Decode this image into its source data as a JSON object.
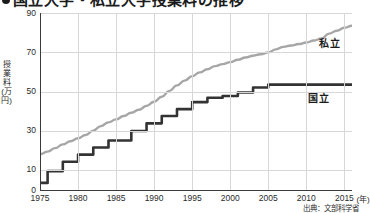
{
  "title": {
    "text": "国立大学・私立大学授業料の推移",
    "bullet": "bullet-marker",
    "cropped": true
  },
  "axes": {
    "y_title": "授業料(万円)",
    "y_ticks": [
      "90",
      "70",
      "50",
      "30",
      "10",
      "0"
    ],
    "y_tick_values": [
      90,
      70,
      50,
      30,
      10,
      0
    ],
    "y_min": 0,
    "y_max": 90,
    "x_ticks": [
      "1975",
      "1980",
      "1985",
      "1990",
      "1995",
      "2000",
      "2005",
      "2010",
      "2015"
    ],
    "x_tick_values": [
      1975,
      1980,
      1985,
      1990,
      1995,
      2000,
      2005,
      2010,
      2015
    ],
    "x_unit": "(年)",
    "x_min": 1975,
    "x_max": 2016
  },
  "series_labels": {
    "private": "私立",
    "national": "国立"
  },
  "source": "出典：文部科学省",
  "colors": {
    "private_line": "#a6a6a6",
    "national_line": "#333333",
    "grid": "#d7d7d7",
    "axis": "#3a3a3a",
    "text": "#1b1b1b",
    "background": "#ffffff"
  },
  "chart_data": {
    "type": "line",
    "title": "国立大学・私立大学授業料の推移",
    "xlabel": "(年)",
    "ylabel": "授業料(万円)",
    "xlim": [
      1975,
      2016
    ],
    "ylim": [
      0,
      90
    ],
    "grid": true,
    "legend": "inline-labels-right",
    "x": [
      1975,
      1976,
      1977,
      1978,
      1979,
      1980,
      1981,
      1982,
      1983,
      1984,
      1985,
      1986,
      1987,
      1988,
      1989,
      1990,
      1991,
      1992,
      1993,
      1994,
      1995,
      1996,
      1997,
      1998,
      1999,
      2000,
      2001,
      2002,
      2003,
      2004,
      2005,
      2006,
      2007,
      2008,
      2009,
      2010,
      2011,
      2012,
      2013,
      2014,
      2015,
      2016
    ],
    "series": [
      {
        "name": "私立",
        "color": "#a6a6a6",
        "style": "smooth",
        "values": [
          18.2,
          19.5,
          21.3,
          23.2,
          24.8,
          26.3,
          28.0,
          30.2,
          32.5,
          34.4,
          35.9,
          37.6,
          39.3,
          40.8,
          42.8,
          44.9,
          47.4,
          50.4,
          53.2,
          55.6,
          57.9,
          59.8,
          61.4,
          63.0,
          64.0,
          65.0,
          66.2,
          67.4,
          68.3,
          69.0,
          70.0,
          71.5,
          72.8,
          73.5,
          74.2,
          75.0,
          76.0,
          77.0,
          79.5,
          81.0,
          82.5,
          83.5
        ]
      },
      {
        "name": "国立",
        "color": "#333333",
        "style": "step",
        "values": [
          3.6,
          9.6,
          9.6,
          14.4,
          14.4,
          18.0,
          18.0,
          21.6,
          21.6,
          25.2,
          25.2,
          25.2,
          30.0,
          30.0,
          33.9,
          33.9,
          37.6,
          37.6,
          41.1,
          41.1,
          44.7,
          44.7,
          46.9,
          46.9,
          47.8,
          47.8,
          49.6,
          49.6,
          52.1,
          52.1,
          53.6,
          53.6,
          53.6,
          53.6,
          53.6,
          53.6,
          53.6,
          53.6,
          53.6,
          53.6,
          53.6,
          53.6
        ]
      }
    ]
  }
}
